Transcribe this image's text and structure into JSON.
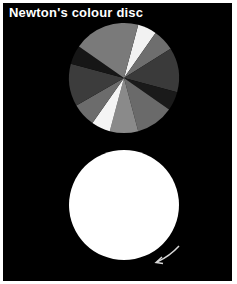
{
  "title": "Newton's colour disc",
  "colour_disc": {
    "center": [
      124,
      78
    ],
    "radius": 55,
    "segments": [
      {
        "start": 15,
        "end": 35,
        "fill": "#f2f2f2"
      },
      {
        "start": 35,
        "end": 58,
        "fill": "#6e6e6e"
      },
      {
        "start": 58,
        "end": 105,
        "fill": "#3a3a3a"
      },
      {
        "start": 105,
        "end": 125,
        "fill": "#1a1a1a"
      },
      {
        "start": 125,
        "end": 165,
        "fill": "#6a6a6a"
      },
      {
        "start": 165,
        "end": 195,
        "fill": "#8a8a8a"
      },
      {
        "start": 195,
        "end": 215,
        "fill": "#f4f4f4"
      },
      {
        "start": 215,
        "end": 240,
        "fill": "#6c6c6c"
      },
      {
        "start": 240,
        "end": 285,
        "fill": "#3c3c3c"
      },
      {
        "start": 285,
        "end": 305,
        "fill": "#161616"
      },
      {
        "start": 305,
        "end": 375,
        "fill": "#7a7a7a"
      }
    ]
  },
  "spinning_disc": {
    "center": [
      124,
      205
    ],
    "radius": 55,
    "fill": "#ffffff"
  },
  "rotation_arrow": {
    "direction": "clockwise",
    "color": "#d8d8d8"
  }
}
